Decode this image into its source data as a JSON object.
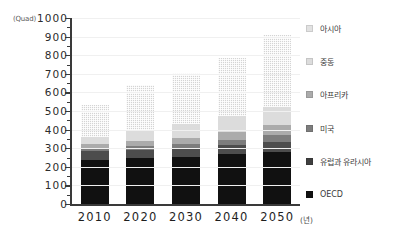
{
  "chart_data": {
    "type": "bar",
    "stacked": true,
    "title": "",
    "subtitle": "",
    "xlabel": "(년)",
    "ylabel": "(Quad)",
    "categories": [
      "2010",
      "2020",
      "2030",
      "2040",
      "2050"
    ],
    "ylim": [
      0,
      1000
    ],
    "ytick_values": [
      0,
      100,
      200,
      300,
      400,
      500,
      600,
      700,
      800,
      900,
      1000
    ],
    "ytick_labels": [
      "0",
      "100",
      "200",
      "300",
      "400",
      "500",
      "600",
      "700",
      "800",
      "900",
      "1000"
    ],
    "grid": true,
    "legend_position": "right",
    "totals": [
      535,
      640,
      705,
      785,
      910
    ],
    "series": [
      {
        "name": "OECD",
        "color": "#111111",
        "values": [
          237,
          250,
          252,
          267,
          280
        ]
      },
      {
        "name": "유럽과 유라시아",
        "color": "#4d4d4d",
        "values": [
          48,
          42,
          45,
          48,
          55
        ]
      },
      {
        "name": "미국",
        "color": "#7d7d7d",
        "values": [
          18,
          22,
          25,
          30,
          38
        ]
      },
      {
        "name": "아프리카",
        "color": "#ababab",
        "values": [
          18,
          26,
          33,
          40,
          52
        ]
      },
      {
        "name": "중동",
        "color": "#dcdcdc",
        "values": [
          42,
          60,
          75,
          90,
          95
        ]
      },
      {
        "name": "아시아",
        "color": "#d4d4d4",
        "values": [
          172,
          240,
          275,
          310,
          390
        ]
      }
    ]
  },
  "axes": {
    "y_unit": "(Quad)",
    "x_unit": "(년)"
  },
  "legend": {
    "items": [
      {
        "label": "아시아",
        "swatch": "#e2e2e2"
      },
      {
        "label": "중동",
        "swatch": "#dcdcdc"
      },
      {
        "label": "아프리카",
        "swatch": "#ababab"
      },
      {
        "label": "미국",
        "swatch": "#7d7d7d"
      },
      {
        "label": "유럽과 유라시아",
        "swatch": "#3f3f3f"
      },
      {
        "label": "OECD",
        "swatch": "#111111"
      }
    ]
  }
}
